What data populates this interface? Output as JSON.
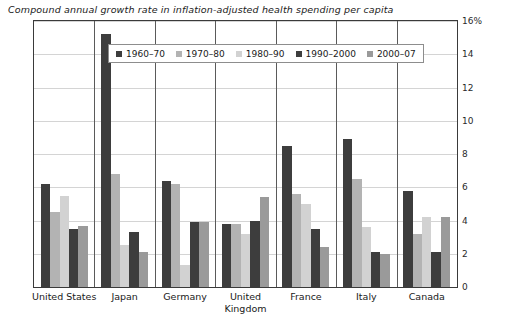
{
  "chart_data": {
    "type": "bar",
    "title": "Compound annual growth rate in inflation-adjusted health spending per capita",
    "xlabel": "",
    "ylabel": "",
    "ylim": [
      0,
      16
    ],
    "ytick_labels": [
      "16%",
      "14",
      "12",
      "10",
      "8",
      "6",
      "4",
      "2",
      "0"
    ],
    "ytick_values": [
      16,
      14,
      12,
      10,
      8,
      6,
      4,
      2,
      0
    ],
    "grid": true,
    "legend_position": "top-center",
    "categories": [
      "United States",
      "Japan",
      "Germany",
      "United Kingdom",
      "France",
      "Italy",
      "Canada"
    ],
    "category_lines": [
      [
        "United States"
      ],
      [
        "Japan"
      ],
      [
        "Germany"
      ],
      [
        "United",
        "Kingdom"
      ],
      [
        "France"
      ],
      [
        "Italy"
      ],
      [
        "Canada"
      ]
    ],
    "series": [
      {
        "name": "1960–70",
        "color": "#3d3d3d",
        "values": [
          6.2,
          15.2,
          6.4,
          3.8,
          8.5,
          8.9,
          5.8
        ]
      },
      {
        "name": "1970–80",
        "color": "#b3b3b3",
        "values": [
          4.5,
          6.8,
          6.2,
          3.8,
          5.6,
          6.5,
          3.2
        ]
      },
      {
        "name": "1980–90",
        "color": "#d2d2d2",
        "values": [
          5.5,
          2.5,
          1.3,
          3.2,
          5.0,
          3.6,
          4.2
        ]
      },
      {
        "name": "1990–2000",
        "color": "#3d3d3d",
        "values": [
          3.5,
          3.3,
          3.9,
          4.0,
          3.5,
          2.1,
          2.1
        ]
      },
      {
        "name": "2000–07",
        "color": "#9a9a9a",
        "values": [
          3.7,
          2.1,
          3.9,
          5.4,
          2.4,
          2.0,
          4.2
        ]
      }
    ]
  },
  "axis": {
    "y_unit_suffix": "%"
  },
  "colors": {
    "frame": "#3a3a3a",
    "grid": "#d4d4d4",
    "text": "#1a1a1a",
    "legend_border": "#8d8d8d"
  }
}
